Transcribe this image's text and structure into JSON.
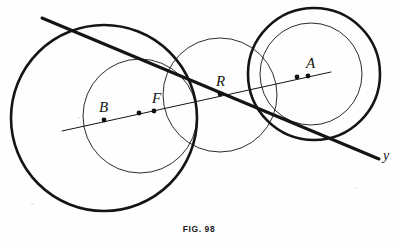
{
  "figure": {
    "caption": "FIG. 98",
    "background_color": "#fefefe",
    "ink_color": "#141414",
    "width": 398,
    "height": 245
  },
  "labels": {
    "point_a": "A",
    "point_b": "B",
    "point_f": "F",
    "point_r": "R",
    "axis_y": "y"
  },
  "chart_data": {
    "type": "diagram",
    "title": "FIG. 98",
    "coordinate_system": "pixels, origin top-left, 398x245",
    "circles": [
      {
        "name": "large-left-circle",
        "cx": 104,
        "cy": 118,
        "r": 93,
        "stroke_width": 2.6,
        "style": "thick"
      },
      {
        "name": "inner-left-circle",
        "cx": 140,
        "cy": 116,
        "r": 57,
        "stroke_width": 0.9,
        "style": "thin"
      },
      {
        "name": "middle-circle",
        "cx": 220,
        "cy": 95,
        "r": 57,
        "stroke_width": 0.9,
        "style": "thin"
      },
      {
        "name": "outer-right-circle",
        "cx": 314,
        "cy": 74,
        "r": 66,
        "stroke_width": 2.6,
        "style": "thick"
      },
      {
        "name": "inner-right-circle",
        "cx": 311,
        "cy": 74,
        "r": 51,
        "stroke_width": 0.9,
        "style": "thin"
      }
    ],
    "lines": [
      {
        "name": "thin-secant-line",
        "x1": 62,
        "y1": 131,
        "x2": 331,
        "y2": 72,
        "stroke_width": 1.0,
        "style": "thin"
      },
      {
        "name": "thick-transversal-line",
        "x1": 42,
        "y1": 18,
        "x2": 379,
        "y2": 159,
        "stroke_width": 3.0,
        "style": "thick"
      }
    ],
    "points": [
      {
        "name": "point-b",
        "label": "B",
        "x": 104,
        "y": 120,
        "label_x": 99,
        "label_y": 100
      },
      {
        "name": "point-midpoint",
        "label": "",
        "x": 139,
        "y": 113,
        "label_x": null,
        "label_y": null
      },
      {
        "name": "point-f",
        "label": "F",
        "x": 154,
        "y": 111,
        "label_x": 152,
        "label_y": 91
      },
      {
        "name": "point-r",
        "label": "R",
        "x": 220,
        "y": 94,
        "label_x": 216,
        "label_y": 74
      },
      {
        "name": "point-a1",
        "label": "",
        "x": 297,
        "y": 77,
        "label_x": null,
        "label_y": null
      },
      {
        "name": "point-a2",
        "label": "A",
        "x": 308,
        "y": 76,
        "label_x": 306,
        "label_y": 56
      }
    ],
    "annotations": [
      {
        "name": "axis-label-y",
        "text": "y",
        "x": 383,
        "y": 149
      }
    ]
  }
}
